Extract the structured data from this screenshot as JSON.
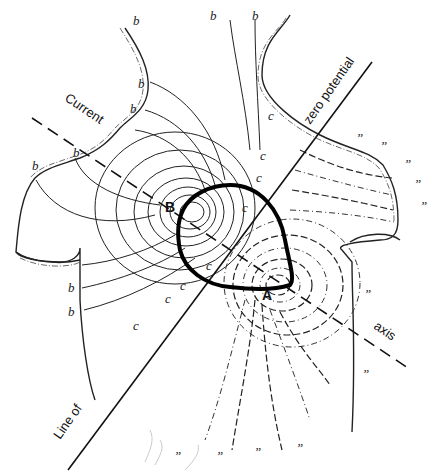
{
  "figure": {
    "labels": {
      "current_axis_start": "Current",
      "current_axis_end": "axis",
      "zero_line_start": "Line of",
      "zero_line_end": "zero potential",
      "point_b": "B",
      "point_a": "A"
    },
    "region_markers": {
      "positive": "b",
      "zero": "c",
      "negative": "”"
    },
    "legend": {
      "solid_lines": "positive isopotential lines",
      "dashed_lines": "negative isopotential lines"
    },
    "colors": {
      "ink": "#111111",
      "background": "#ffffff"
    }
  }
}
